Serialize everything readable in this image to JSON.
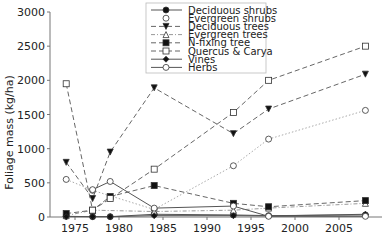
{
  "chart_data": {
    "type": "line",
    "title": "",
    "xlabel": "",
    "ylabel": "Foliage mass (kg/ha)",
    "xlim": [
      1972,
      2009
    ],
    "ylim": [
      0,
      3000
    ],
    "xticks": [
      1975,
      1980,
      1985,
      1990,
      1995,
      2000,
      2005
    ],
    "yticks": [
      0,
      500,
      1000,
      1500,
      2000,
      2500,
      3000
    ],
    "grid": false,
    "legend_position": "top-center",
    "series": [
      {
        "name": "Deciduous shrubs",
        "marker": "filled-circle",
        "line": "solid",
        "x": [
          1974,
          1977,
          1979,
          1984,
          1993,
          1997,
          2008
        ],
        "values": [
          10,
          5,
          5,
          40,
          30,
          20,
          30
        ]
      },
      {
        "name": "Evergreen shrubs",
        "marker": "open-circle",
        "line": "dotted",
        "x": [
          1974,
          1977,
          1984,
          1993,
          1997,
          2008
        ],
        "values": [
          550,
          390,
          110,
          750,
          1140,
          1560
        ]
      },
      {
        "name": "Deciduous trees",
        "marker": "filled-triangle-down",
        "line": "dashed",
        "x": [
          1974,
          1977,
          1979,
          1984,
          1993,
          1997,
          2008
        ],
        "values": [
          800,
          270,
          950,
          1890,
          1220,
          1580,
          2090
        ]
      },
      {
        "name": "Evergreen trees",
        "marker": "open-triangle",
        "line": "dash-dot",
        "x": [
          1974,
          1977,
          1984,
          1993,
          1997,
          2008
        ],
        "values": [
          20,
          100,
          80,
          100,
          130,
          200
        ]
      },
      {
        "name": "N-fixing tree",
        "marker": "filled-square",
        "line": "dashed",
        "x": [
          1974,
          1977,
          1979,
          1984,
          1993,
          1997,
          2008
        ],
        "values": [
          50,
          100,
          300,
          460,
          200,
          150,
          240
        ]
      },
      {
        "name": "Quercus & Carya",
        "marker": "open-square",
        "line": "dashed",
        "x": [
          1974,
          1977,
          1979,
          1984,
          1993,
          1997,
          2008
        ],
        "values": [
          1950,
          100,
          270,
          700,
          1530,
          2000,
          2500
        ]
      },
      {
        "name": "Vines",
        "marker": "filled-diamond",
        "line": "solid",
        "x": [
          1974,
          1977,
          1979,
          1984,
          1993,
          1997,
          2008
        ],
        "values": [
          5,
          5,
          5,
          20,
          20,
          15,
          40
        ]
      },
      {
        "name": "Herbs",
        "marker": "open-circle",
        "line": "solid",
        "x": [
          1977,
          1979,
          1984,
          1993,
          1997,
          2008
        ],
        "values": [
          400,
          520,
          130,
          160,
          10,
          10
        ]
      }
    ]
  }
}
